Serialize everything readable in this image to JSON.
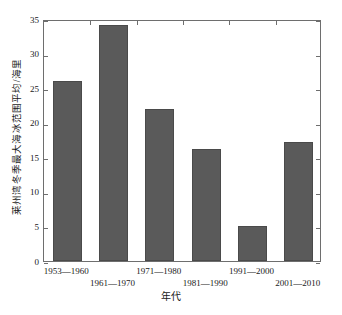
{
  "chart_data": {
    "type": "bar",
    "title": "",
    "xlabel": "年代",
    "ylabel": "莱州湾冬季最大海冰范围平均/海里",
    "categories": [
      "1953—1960",
      "1961—1970",
      "1971—1980",
      "1981—1990",
      "1991—2000",
      "2001—2010"
    ],
    "values": [
      26.0,
      34.1,
      22.0,
      16.2,
      5.1,
      17.2
    ],
    "ylim": [
      0,
      35
    ],
    "yticks": [
      0,
      5,
      10,
      15,
      20,
      25,
      30,
      35
    ],
    "ytick_labels": [
      "0",
      "5",
      "10",
      "15",
      "20",
      "25",
      "30",
      "35"
    ],
    "grid": false,
    "legend": null,
    "bar_color": "#5a5a5a",
    "axis_color": "#6e6e6e",
    "background": "#ffffff"
  }
}
